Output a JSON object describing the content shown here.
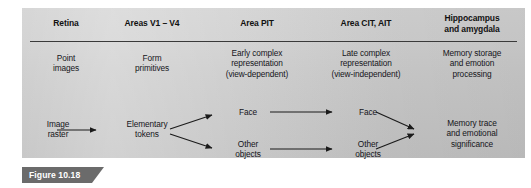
{
  "figure": {
    "caption_label": "Figure 10.18",
    "banner_color": "#6b6b6b",
    "panel_color": "#cbcbcb",
    "rule_color": "#3a3a3a",
    "text_color": "#15151a"
  },
  "columns": [
    {
      "header": "Retina"
    },
    {
      "header": "Areas V1 – V4"
    },
    {
      "header": "Area PIT"
    },
    {
      "header": "Area CIT, AIT"
    },
    {
      "header_line1": "Hippocampus",
      "header_line2": "and amygdala"
    }
  ],
  "row_descriptions": {
    "retina": {
      "line1": "Point",
      "line2": "images"
    },
    "v1v4": {
      "line1": "Form",
      "line2": "primitives"
    },
    "pit": {
      "line1": "Early complex",
      "line2": "representation",
      "line3": "(view-dependent)"
    },
    "cit_ait": {
      "line1": "Late complex",
      "line2": "representation",
      "line3": "(view-independent)"
    },
    "hippocampus": {
      "line1": "Memory storage",
      "line2": "and emotion",
      "line3": "processing"
    }
  },
  "flow": {
    "input": {
      "line1": "Image",
      "line2": "raster"
    },
    "tokens": {
      "line1": "Elementary",
      "line2": "tokens"
    },
    "pit_face": "Face",
    "pit_other": {
      "line1": "Other",
      "line2": "objects"
    },
    "cit_face": "Face",
    "cit_other": {
      "line1": "Other",
      "line2": "objects"
    },
    "output": {
      "line1": "Memory trace",
      "line2": "and emotional",
      "line3": "significance"
    }
  }
}
